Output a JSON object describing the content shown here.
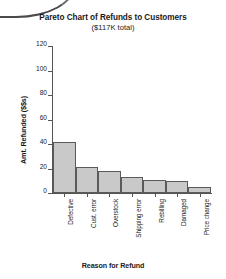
{
  "chart_data": {
    "type": "bar",
    "title": "Pareto Chart of Refunds to Customers",
    "subtitle": "($117K total)",
    "xlabel": "Reason for Refund",
    "ylabel": "Amt. Refunded ($$s)",
    "categories": [
      "Defective",
      "Cust. error",
      "Overstock",
      "Shipping error",
      "Rebilling",
      "Damaged",
      "Price change"
    ],
    "values": [
      42,
      21,
      18,
      13,
      11,
      10,
      5
    ],
    "ylim": [
      0,
      120
    ],
    "yticks": [
      0,
      20,
      40,
      60,
      80,
      100,
      120
    ],
    "ytick_labels": [
      "0",
      "20",
      "40",
      "60",
      "80",
      "100",
      "120"
    ],
    "grid": false,
    "legend": "none",
    "bar_fill": "#c9c9c9",
    "bar_edge": "#5a5a5a",
    "axis_color": "#555555",
    "background": "#ffffff"
  }
}
